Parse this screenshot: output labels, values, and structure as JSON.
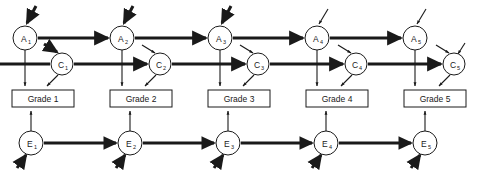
{
  "diagram": {
    "colors": {
      "stroke": "#1a1a1a",
      "node_fill": "#ffffff",
      "box_fill": "#ffffff",
      "background": "#ffffff"
    },
    "layout": {
      "width": 479,
      "height": 179,
      "column_pitch": 97.7,
      "row_a_y": 38,
      "row_c_y": 64,
      "row_grade_y": 99,
      "row_e_y": 143
    },
    "rows": {
      "a_label": "A",
      "c_label": "C",
      "e_label": "E",
      "grade_prefix": "Grade"
    },
    "a_nodes": [
      {
        "id": "a1",
        "label": "A",
        "sub": "1",
        "cx": 25,
        "cy": 38,
        "r": 12,
        "incoming_weight": "thick"
      },
      {
        "id": "a2",
        "label": "A",
        "sub": "2",
        "cx": 122,
        "cy": 38,
        "r": 12,
        "incoming_weight": "thick"
      },
      {
        "id": "a3",
        "label": "A",
        "sub": "3",
        "cx": 220,
        "cy": 38,
        "r": 12,
        "incoming_weight": "thick"
      },
      {
        "id": "a4",
        "label": "A",
        "sub": "4",
        "cx": 317,
        "cy": 38,
        "r": 12,
        "incoming_weight": "thin"
      },
      {
        "id": "a5",
        "label": "A",
        "sub": "5",
        "cx": 415,
        "cy": 38,
        "r": 12,
        "incoming_weight": "thin"
      }
    ],
    "c_nodes": [
      {
        "id": "c1",
        "label": "C",
        "sub": "1",
        "cx": 62,
        "cy": 64,
        "r": 11,
        "incoming_weight": "thick"
      },
      {
        "id": "c2",
        "label": "C",
        "sub": "2",
        "cx": 160,
        "cy": 64,
        "r": 11,
        "incoming_weight": "thin"
      },
      {
        "id": "c3",
        "label": "C",
        "sub": "3",
        "cx": 258,
        "cy": 64,
        "r": 11,
        "incoming_weight": "thin"
      },
      {
        "id": "c4",
        "label": "C",
        "sub": "4",
        "cx": 356,
        "cy": 64,
        "r": 11,
        "incoming_weight": "thin"
      },
      {
        "id": "c5",
        "label": "C",
        "sub": "5",
        "cx": 454,
        "cy": 64,
        "r": 11,
        "incoming_weight": "thin"
      }
    ],
    "e_nodes": [
      {
        "id": "e1",
        "label": "E",
        "sub": "1",
        "cx": 31,
        "cy": 143,
        "r": 12
      },
      {
        "id": "e2",
        "label": "E",
        "sub": "2",
        "cx": 130,
        "cy": 143,
        "r": 12
      },
      {
        "id": "e3",
        "label": "E",
        "sub": "3",
        "cx": 228,
        "cy": 143,
        "r": 12
      },
      {
        "id": "e4",
        "label": "E",
        "sub": "4",
        "cx": 326,
        "cy": 143,
        "r": 12
      },
      {
        "id": "e5",
        "label": "E",
        "sub": "5",
        "cx": 425,
        "cy": 143,
        "r": 12
      }
    ],
    "grade_boxes": [
      {
        "id": "g1",
        "label": "Grade 1",
        "x": 12,
        "y": 90,
        "w": 62,
        "h": 17
      },
      {
        "id": "g2",
        "label": "Grade 2",
        "x": 110,
        "y": 90,
        "w": 62,
        "h": 17
      },
      {
        "id": "g3",
        "label": "Grade 3",
        "x": 208,
        "y": 90,
        "w": 62,
        "h": 17
      },
      {
        "id": "g4",
        "label": "Grade 4",
        "x": 306,
        "y": 90,
        "w": 62,
        "h": 17
      },
      {
        "id": "g5",
        "label": "Grade 5",
        "x": 404,
        "y": 90,
        "w": 62,
        "h": 17
      }
    ]
  }
}
